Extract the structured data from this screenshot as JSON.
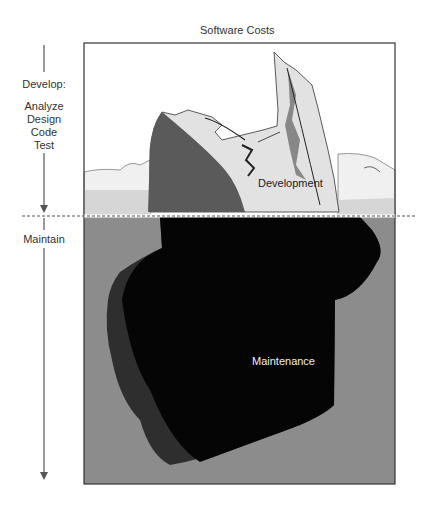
{
  "diagram": {
    "title": "Software Costs",
    "phases": {
      "develop": {
        "label": "Develop:",
        "steps": [
          "Analyze",
          "Design",
          "Code",
          "Test"
        ]
      },
      "maintain": {
        "label": "Maintain"
      }
    },
    "iceberg": {
      "above_water_label": "Development",
      "below_water_label": "Maintenance"
    },
    "colors": {
      "sky": "#ffffff",
      "ice_light": "#e2e2e2",
      "ice_shadow": "#5a5a5a",
      "water": "#8c8c8c",
      "underwater_mass": "#050505",
      "underwater_shadow": "#2e2e2e",
      "waterline": "#666666"
    }
  }
}
